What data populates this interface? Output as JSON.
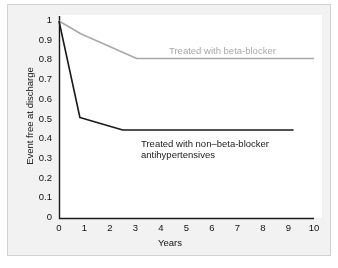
{
  "figure": {
    "background_color": "#f2f2f2",
    "border_color": "#d2d2d2",
    "plot_background_color": "#ffffff"
  },
  "chart_data": {
    "type": "line",
    "title": "",
    "subtitle": "",
    "xlabel": "Years",
    "ylabel": "Event free at discharge",
    "xlim": [
      0,
      10
    ],
    "ylim": [
      0,
      1
    ],
    "grid": false,
    "legend_position": "inline-annotations",
    "xticks": [
      "0",
      "1",
      "2",
      "3",
      "4",
      "5",
      "6",
      "7",
      "8",
      "9",
      "10"
    ],
    "xtick_values": [
      0,
      1,
      2,
      3,
      4,
      5,
      6,
      7,
      8,
      9,
      10
    ],
    "yticks": [
      "0",
      "0.1",
      "0.2",
      "0.3",
      "0.4",
      "0.5",
      "0.6",
      "0.7",
      "0.8",
      "0.9",
      "1"
    ],
    "ytick_values": [
      0,
      0.1,
      0.2,
      0.3,
      0.4,
      0.5,
      0.6,
      0.7,
      0.8,
      0.9,
      1.0
    ],
    "series": [
      {
        "name": "Treated with beta-blocker",
        "color": "#a9a9a9",
        "width": 1.6,
        "x": [
          0,
          0.85,
          3.05,
          10
        ],
        "values": [
          1.0,
          0.935,
          0.81,
          0.81
        ]
      },
      {
        "name": "Treated with non–beta-blocker antihypertensives",
        "color": "#1a1a1a",
        "width": 1.6,
        "x": [
          0,
          0.82,
          2.5,
          9.2
        ],
        "values": [
          1.0,
          0.51,
          0.447,
          0.447
        ]
      }
    ],
    "annotations": [
      {
        "name": "beta-blocker-label",
        "text": "Treated with beta-blocker",
        "color": "#a9a9a9",
        "x": 3.3,
        "y": 0.865
      },
      {
        "name": "non-beta-blocker-label",
        "text": "Treated with non–beta-blocker\nantihypertensives",
        "color": "#1a1a1a",
        "x": 2.5,
        "y": 0.405
      }
    ]
  }
}
